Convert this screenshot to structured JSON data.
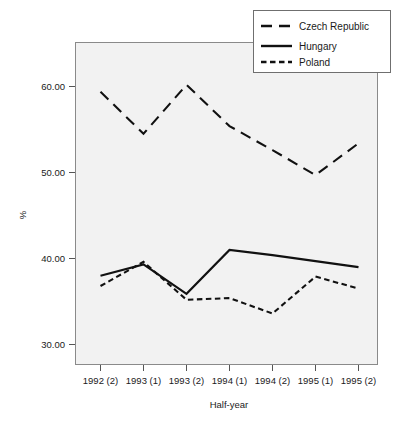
{
  "chart_data": {
    "type": "line",
    "title": "",
    "xlabel": "Half-year",
    "ylabel": "%",
    "categories": [
      "1992 (2)",
      "1993 (1)",
      "1993 (2)",
      "1994 (1)",
      "1994 (2)",
      "1995 (1)",
      "1995 (2)"
    ],
    "ylim": [
      26.0,
      63.0
    ],
    "yticks": [
      30.0,
      40.0,
      50.0,
      60.0
    ],
    "ytick_labels": [
      "30.00",
      "40.00",
      "50.00",
      "60.00"
    ],
    "grid": false,
    "legend_position": "top-right",
    "series": [
      {
        "name": "Czech Republic",
        "style": "long-dash",
        "values": [
          59.4,
          54.5,
          60.2,
          55.4,
          52.6,
          49.7,
          53.4
        ]
      },
      {
        "name": "Hungary",
        "style": "solid",
        "values": [
          38.0,
          39.3,
          35.9,
          41.0,
          40.4,
          39.7,
          39.0
        ]
      },
      {
        "name": "Poland",
        "style": "short-dash",
        "values": [
          36.8,
          39.6,
          35.2,
          35.4,
          33.6,
          37.9,
          36.5
        ]
      }
    ]
  },
  "legend": {
    "items": [
      {
        "label": "Czech Republic"
      },
      {
        "label": "Hungary"
      },
      {
        "label": "Poland"
      }
    ]
  },
  "axes": {
    "y_label": "%",
    "x_label": "Half-year",
    "y_tick_labels": [
      "60.00",
      "50.00",
      "40.00",
      "30.00"
    ],
    "x_tick_labels": [
      "1992 (2)",
      "1993 (1)",
      "1993 (2)",
      "1994 (1)",
      "1994 (2)",
      "1995 (1)",
      "1995 (2)"
    ]
  }
}
